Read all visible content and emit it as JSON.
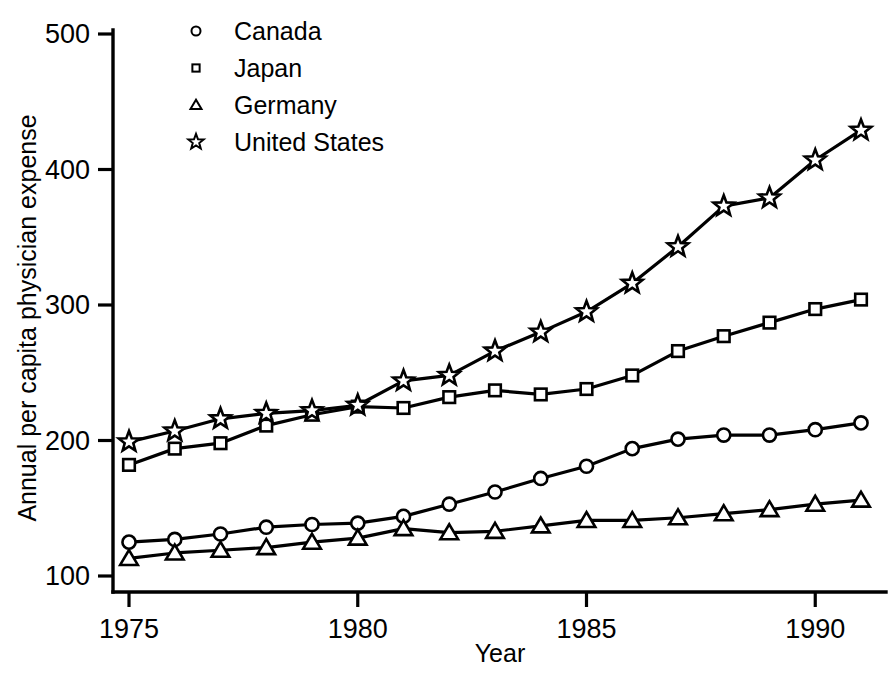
{
  "chart_data": {
    "type": "line",
    "title": "",
    "xlabel": "Year",
    "ylabel": "Annual per capita physician expense",
    "xlim": [
      1975,
      1991
    ],
    "ylim": [
      100,
      500
    ],
    "grid": false,
    "legend_position": "top-left-inside",
    "x_ticks": [
      "1975",
      "1980",
      "1985",
      "1990"
    ],
    "x_tick_values": [
      1975,
      1980,
      1985,
      1990
    ],
    "y_ticks": [
      "100",
      "200",
      "300",
      "400",
      "500"
    ],
    "y_tick_values": [
      100,
      200,
      300,
      400,
      500
    ],
    "x": [
      1975,
      1976,
      1977,
      1978,
      1979,
      1980,
      1981,
      1982,
      1983,
      1984,
      1985,
      1986,
      1987,
      1988,
      1989,
      1990,
      1991
    ],
    "series": [
      {
        "name": "Canada",
        "marker": "circle",
        "values": [
          125,
          127,
          131,
          136,
          138,
          139,
          144,
          153,
          162,
          172,
          181,
          194,
          201,
          204,
          204,
          208,
          213
        ]
      },
      {
        "name": "Japan",
        "marker": "square",
        "values": [
          182,
          194,
          198,
          211,
          219,
          225,
          224,
          232,
          237,
          234,
          238,
          248,
          266,
          277,
          287,
          297,
          304
        ]
      },
      {
        "name": "Germany",
        "marker": "triangle",
        "values": [
          113,
          117,
          119,
          121,
          125,
          128,
          135,
          132,
          133,
          137,
          141,
          141,
          143,
          146,
          149,
          153,
          156
        ]
      },
      {
        "name": "United States",
        "marker": "star",
        "values": [
          199,
          207,
          216,
          220,
          222,
          226,
          244,
          248,
          266,
          280,
          295,
          316,
          343,
          373,
          379,
          407,
          429
        ]
      }
    ]
  },
  "legend": {
    "entries": [
      {
        "label": "Canada",
        "marker": "circle"
      },
      {
        "label": "Japan",
        "marker": "square"
      },
      {
        "label": "Germany",
        "marker": "triangle"
      },
      {
        "label": "United States",
        "marker": "star"
      }
    ]
  },
  "axes": {
    "x_title": "Year",
    "y_title": "Annual per capita physician expense"
  }
}
